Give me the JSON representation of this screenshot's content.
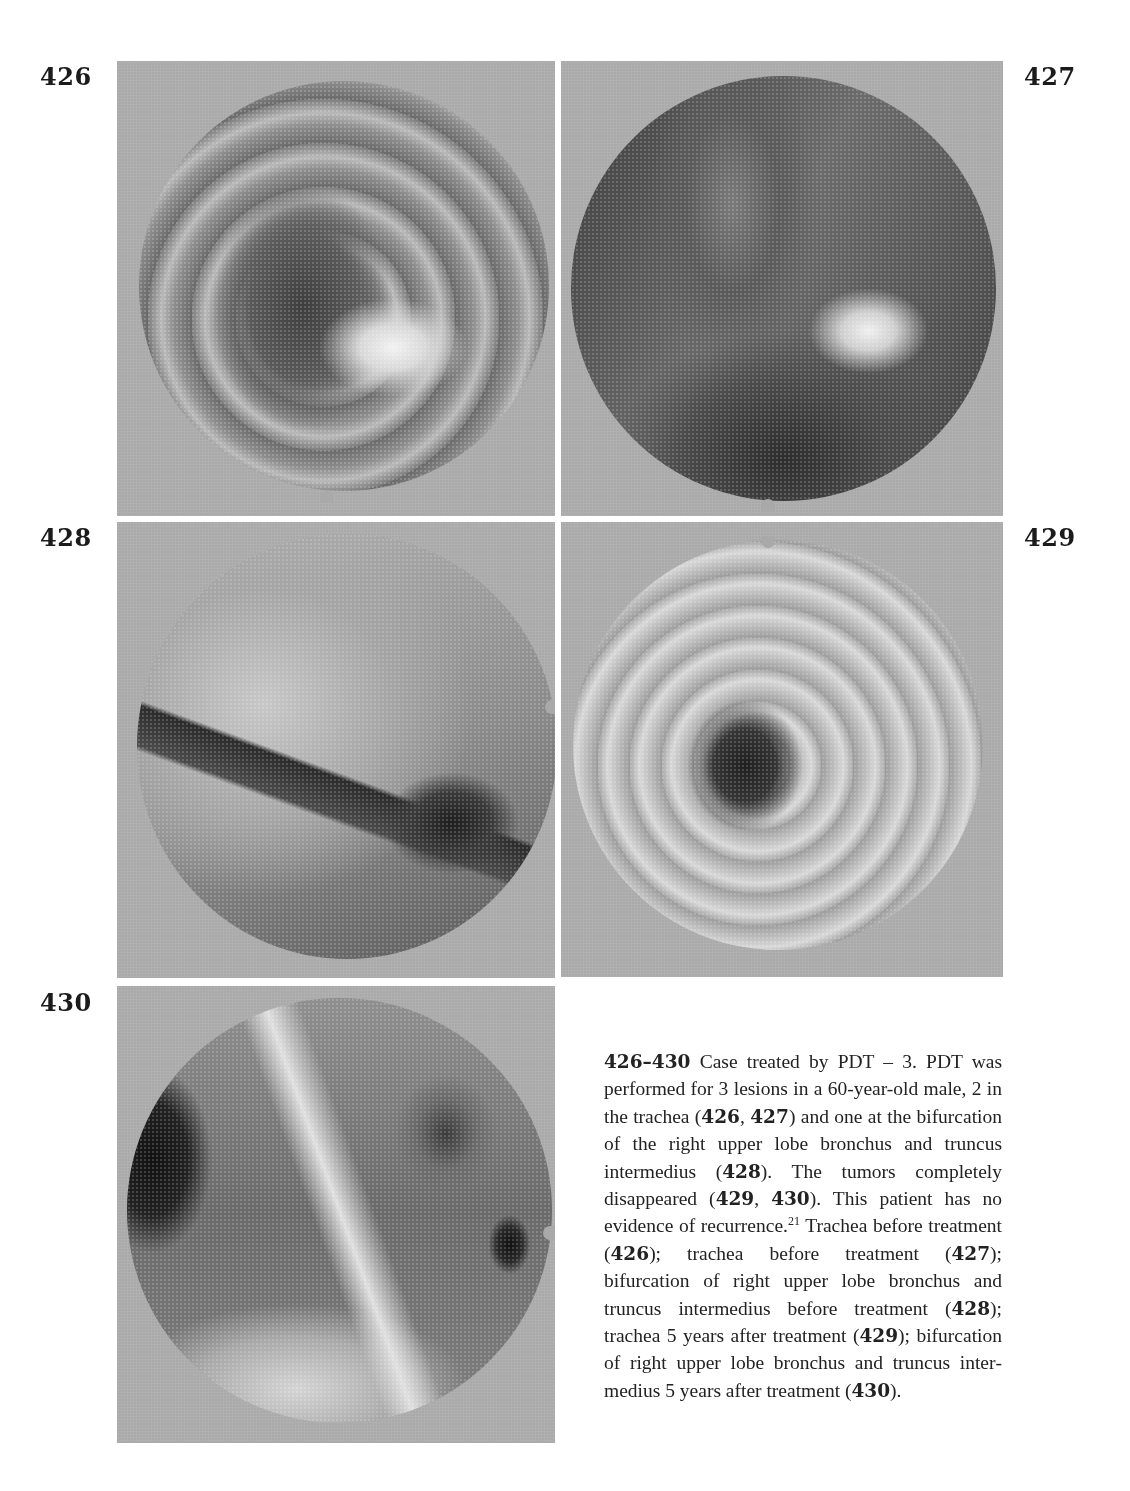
{
  "figures": [
    {
      "number": "426",
      "description": "Trachea before treatment"
    },
    {
      "number": "427",
      "description": "Trachea before treatment"
    },
    {
      "number": "428",
      "description": "Bifurcation of right upper lobe bronchus and truncus intermedius before treatment"
    },
    {
      "number": "429",
      "description": "Trachea 5 years after treatment"
    },
    {
      "number": "430",
      "description": "Bifurcation of right upper lobe bronchus and truncus intermedius 5 years after treatment"
    }
  ],
  "caption": {
    "range": "426–430",
    "title": "Case treated by PDT – 3.",
    "segments": [
      {
        "t": "PDT was performed for 3 lesions in a 60-year-old male, 2 in the trachea ("
      },
      {
        "b": "426"
      },
      {
        "t": ", "
      },
      {
        "b": "427"
      },
      {
        "t": ") and one at the bifurcation of the right upper lobe bronchus and truncus intermedius ("
      },
      {
        "b": "428"
      },
      {
        "t": "). The tumors completely disappeared ("
      },
      {
        "b": "429"
      },
      {
        "t": ", "
      },
      {
        "b": "430"
      },
      {
        "t": "). This patient has no evidence of recurrence."
      },
      {
        "sup": "21"
      },
      {
        "t": " Trachea be­fore treatment ("
      },
      {
        "b": "426"
      },
      {
        "t": "); trachea before treat­ment ("
      },
      {
        "b": "427"
      },
      {
        "t": "); bifurcation of right upper lobe bronchus and truncus intermedius before treatment ("
      },
      {
        "b": "428"
      },
      {
        "t": "); trachea 5 years after treatment ("
      },
      {
        "b": "429"
      },
      {
        "t": "); bifurcation of right upper lobe bronchus and truncus inter­medius 5 years after treatment ("
      },
      {
        "b": "430"
      },
      {
        "t": ")."
      }
    ]
  }
}
